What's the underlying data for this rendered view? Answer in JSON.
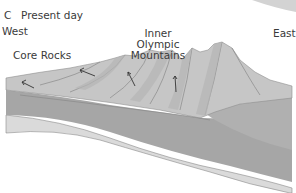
{
  "panel": {
    "letter": "C",
    "title": "Present day"
  },
  "labels": {
    "west": "West",
    "east": "East",
    "core_rocks": "Core Rocks",
    "inner_olympic_line1": "Inner",
    "inner_olympic_line2": "Olympic",
    "inner_olympic_line3": "Mountains"
  },
  "colors": {
    "surface_light": "#c9c9c9",
    "ridge_mid": "#b4b4b4",
    "layer_dark": "#a3a3a3",
    "layer_pale": "#d6d6d6",
    "line": "#555555",
    "background": "#ffffff"
  }
}
